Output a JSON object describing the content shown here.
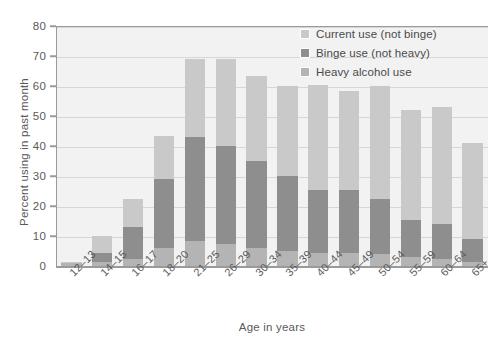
{
  "chart_data": {
    "type": "bar",
    "stacked": true,
    "title": "",
    "xlabel": "Age in years",
    "ylabel": "Percent using in past month",
    "ylim": [
      0,
      80
    ],
    "yticks": [
      0,
      10,
      20,
      30,
      40,
      50,
      60,
      70,
      80
    ],
    "grid": true,
    "legend_position": "top-right",
    "categories": [
      "12–13",
      "14–15",
      "16–17",
      "18–20",
      "21–25",
      "26–29",
      "30–34",
      "35–39",
      "40–44",
      "45–49",
      "50–54",
      "55–59",
      "60–64",
      "65+"
    ],
    "series": [
      {
        "name": "Heavy alcohol use",
        "color": "#b4b4b4",
        "values": [
          1.0,
          1.3,
          2.2,
          5.9,
          8.5,
          7.5,
          6.0,
          5.0,
          4.5,
          4.5,
          4.0,
          3.0,
          2.5,
          1.5
        ]
      },
      {
        "name": "Binge use (not heavy)",
        "color": "#8e8e8e",
        "values": [
          0.3,
          3.2,
          10.8,
          23.1,
          34.5,
          32.5,
          29.0,
          25.0,
          21.0,
          21.0,
          18.5,
          12.5,
          11.5,
          7.5
        ]
      },
      {
        "name": "Current use (not binge)",
        "color": "#c9c9c9",
        "values": [
          0.2,
          5.5,
          9.5,
          14.5,
          26.0,
          29.0,
          28.5,
          30.0,
          35.0,
          33.0,
          37.5,
          36.5,
          39.0,
          32.0
        ]
      }
    ],
    "totals": [
      1.5,
      10.0,
      22.5,
      43.5,
      69.0,
      69.0,
      63.5,
      60.0,
      60.5,
      58.5,
      60.0,
      52.0,
      53.0,
      41.0
    ],
    "cumulative_heavy": [
      1.0,
      1.3,
      2.2,
      5.9,
      8.5,
      7.5,
      6.0,
      5.0,
      4.5,
      4.5,
      4.0,
      3.0,
      2.5,
      1.5
    ],
    "cumulative_binge": [
      1.3,
      4.5,
      13.0,
      29.0,
      43.0,
      40.0,
      35.0,
      30.0,
      25.5,
      25.5,
      22.5,
      15.5,
      14.0,
      9.0
    ]
  },
  "legend": {
    "items": [
      {
        "label": "Current use (not binge)",
        "color": "#c9c9c9"
      },
      {
        "label": "Binge use (not heavy)",
        "color": "#8e8e8e"
      },
      {
        "label": "Heavy alcohol use",
        "color": "#b4b4b4"
      }
    ]
  },
  "axes": {
    "y_title": "Percent using in past month",
    "x_title": "Age in years",
    "y_tick_labels": [
      "0",
      "10",
      "20",
      "30",
      "40",
      "50",
      "60",
      "70",
      "80"
    ],
    "x_tick_labels": [
      "12–13",
      "14–15",
      "16–17",
      "18–20",
      "21–25",
      "26–29",
      "30–34",
      "35–39",
      "40–44",
      "45–49",
      "50–54",
      "55–59",
      "60–64",
      "65+"
    ]
  },
  "colors": {
    "plot_background": "#f2f2f2",
    "gridline": "#d6d6d6",
    "axis": "#9a9a9a",
    "text": "#5a5a5a",
    "current_use": "#c9c9c9",
    "binge_use": "#8e8e8e",
    "heavy_use": "#b4b4b4"
  }
}
